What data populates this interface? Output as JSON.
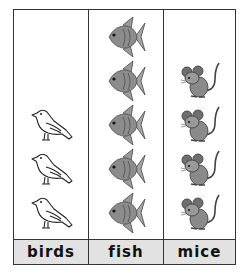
{
  "chart_data": {
    "type": "pictograph",
    "title": "",
    "categories": [
      "birds",
      "fish",
      "mice"
    ],
    "values": [
      3,
      5,
      4
    ],
    "icons": [
      "bird-icon",
      "fish-icon",
      "mouse-icon"
    ],
    "xlabel": "",
    "ylabel": ""
  },
  "columns": [
    {
      "label": "birds",
      "count": 3,
      "icon": "bird-icon"
    },
    {
      "label": "fish",
      "count": 5,
      "icon": "fish-icon"
    },
    {
      "label": "mice",
      "count": 4,
      "icon": "mouse-icon"
    }
  ]
}
